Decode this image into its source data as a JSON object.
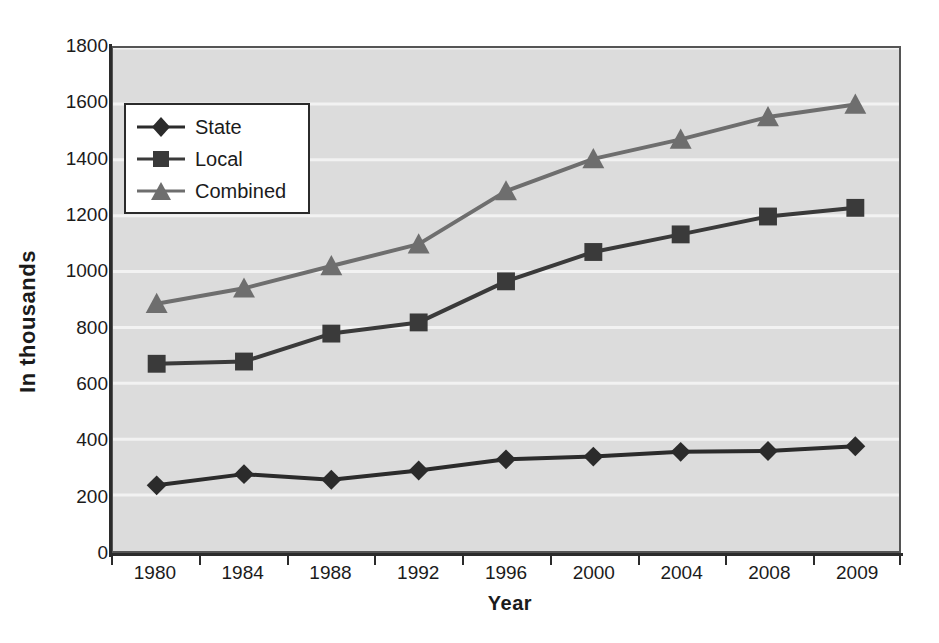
{
  "chart_data": {
    "type": "line",
    "title": "",
    "xlabel": "Year",
    "ylabel": "In thousands",
    "categories": [
      "1980",
      "1984",
      "1988",
      "1992",
      "1996",
      "2000",
      "2004",
      "2008",
      "2009"
    ],
    "ylim": [
      0,
      1800
    ],
    "ytick_values": [
      0,
      200,
      400,
      600,
      800,
      1000,
      1200,
      1400,
      1600,
      1800
    ],
    "ytick_labels": [
      "0",
      "200",
      "400",
      "600",
      "800",
      "1000",
      "1200",
      "1400",
      "1600",
      "1800"
    ],
    "grid": true,
    "grid_color": "#f2f2f2",
    "plot_background": "#dcdcdc",
    "legend_position": "upper left",
    "series": [
      {
        "name": "State",
        "marker": "diamond",
        "color": "#2b2b2b",
        "values": [
          235,
          275,
          255,
          288,
          328,
          338,
          355,
          358,
          375
        ]
      },
      {
        "name": "Local",
        "marker": "square",
        "color": "#3a3a3a",
        "values": [
          670,
          678,
          778,
          818,
          965,
          1070,
          1133,
          1197,
          1228
        ]
      },
      {
        "name": "Combined",
        "marker": "triangle",
        "color": "#6e6e6e",
        "values": [
          885,
          940,
          1020,
          1098,
          1288,
          1403,
          1473,
          1553,
          1598
        ]
      }
    ]
  },
  "axes": {
    "x_title": "Year",
    "y_title": "In thousands"
  },
  "legend": {
    "items": [
      {
        "label": "State"
      },
      {
        "label": "Local"
      },
      {
        "label": "Combined"
      }
    ]
  }
}
